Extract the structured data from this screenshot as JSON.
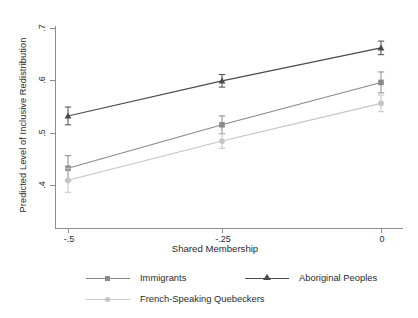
{
  "chart_data": {
    "type": "line",
    "title": "",
    "xlabel": "Shared Membership",
    "ylabel": "Predicted Level of Inclusive Redistribution",
    "x": [
      -0.5,
      -0.25,
      0
    ],
    "xticklabels": [
      "-.5",
      "-.25",
      "0"
    ],
    "yticklabels": [
      ".4",
      ".5",
      ".6",
      ".7"
    ],
    "yticks": [
      0.4,
      0.5,
      0.6,
      0.7
    ],
    "xlim": [
      -0.56,
      0.04
    ],
    "ylim": [
      0.368,
      0.716
    ],
    "grid": false,
    "legend_position": "bottom",
    "series": [
      {
        "name": "Immigrants",
        "marker": "square",
        "color": "#8a8a8a",
        "values": [
          0.432,
          0.515,
          0.596
        ],
        "err_low": [
          0.408,
          0.498,
          0.576
        ],
        "err_high": [
          0.456,
          0.532,
          0.616
        ]
      },
      {
        "name": "Aboriginal Peoples",
        "marker": "triangle",
        "color": "#4a4a4a",
        "values": [
          0.532,
          0.599,
          0.662
        ],
        "err_low": [
          0.515,
          0.587,
          0.649
        ],
        "err_high": [
          0.549,
          0.611,
          0.675
        ]
      },
      {
        "name": "French-Speaking Quebeckers",
        "marker": "circle",
        "color": "#c4c4c4",
        "values": [
          0.409,
          0.484,
          0.556
        ],
        "err_low": [
          0.386,
          0.47,
          0.54
        ],
        "err_high": [
          0.432,
          0.498,
          0.572
        ]
      }
    ]
  },
  "axes": {
    "y_title": "Predicted Level of Inclusive Redistribution",
    "x_title": "Shared Membership",
    "y_ticks": [
      ".7",
      ".6",
      ".5",
      ".4"
    ],
    "x_ticks": [
      "-.5",
      "-.25",
      "0"
    ]
  },
  "legend": {
    "items": [
      {
        "label": "Immigrants",
        "marker": "square-marker",
        "color": "#8a8a8a"
      },
      {
        "label": "Aboriginal Peoples",
        "marker": "triangle-marker",
        "color": "#4a4a4a"
      },
      {
        "label": "French-Speaking Quebeckers",
        "marker": "circle-marker",
        "color": "#c4c4c4"
      }
    ]
  },
  "colors": {
    "axis": "#8d8d8d",
    "text": "#2b2b2b",
    "series_dark": "#4a4a4a",
    "series_mid": "#8a8a8a",
    "series_light": "#c4c4c4"
  }
}
